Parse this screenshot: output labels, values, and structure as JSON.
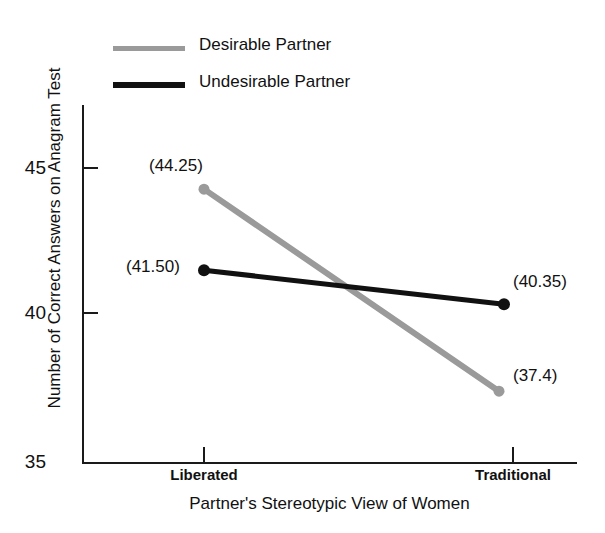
{
  "chart_data": {
    "type": "line",
    "title": "",
    "xlabel": "Partner's Stereotypic View of Women",
    "ylabel": "Number of Correct Answers on Anagram Test",
    "categories": [
      "Liberated",
      "Traditional"
    ],
    "ylim": [
      35,
      46
    ],
    "yticks": [
      35,
      40,
      45
    ],
    "ytick_labels": [
      "35",
      "40",
      "45"
    ],
    "grid": false,
    "legend_position": "top-left",
    "series": [
      {
        "name": "Desirable Partner",
        "color": "#9a9a9a",
        "values": [
          44.25,
          37.4
        ],
        "data_labels": [
          "(44.25)",
          "(37.4)"
        ]
      },
      {
        "name": "Undesirable Partner",
        "color": "#111111",
        "values": [
          41.5,
          40.35
        ],
        "data_labels": [
          "(41.50)",
          "(40.35)"
        ]
      }
    ]
  },
  "axes": {
    "y_title": "Number of Correct Answers on Anagram Test",
    "x_title": "Partner's Stereotypic View of Women",
    "y_tick_45": "45",
    "y_tick_40": "40",
    "y_tick_35": "35",
    "x_tick_left": "Liberated",
    "x_tick_right": "Traditional"
  },
  "legend": {
    "items": [
      {
        "label": "Desirable Partner",
        "color": "#9a9a9a"
      },
      {
        "label": "Undesirable Partner",
        "color": "#111111"
      }
    ]
  },
  "labels": {
    "desirable_left": "(44.25)",
    "desirable_right": "(37.4)",
    "undesirable_left": "(41.50)",
    "undesirable_right": "(40.35)"
  }
}
